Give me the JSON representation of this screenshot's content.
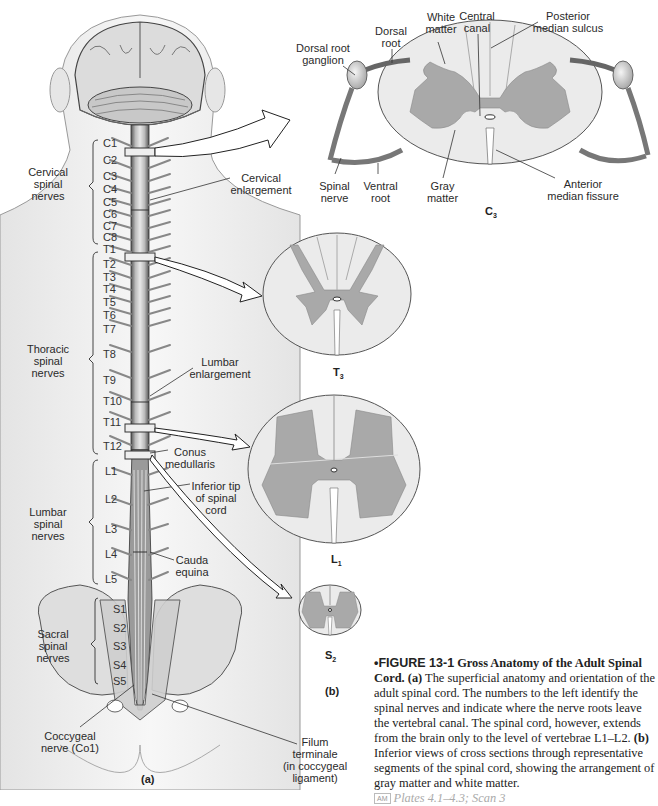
{
  "figure": {
    "number": "•FIGURE 13-1",
    "title": "Gross Anatomy of the Adult Spinal Cord.",
    "panel_a_label": "(a)",
    "panel_b_label": "(b)",
    "caption_a_marker": "(a)",
    "caption_a_text": "The superficial anatomy and orientation of the adult spinal cord. The numbers to the left identify the spinal nerves and indicate where the nerve roots leave the vertebral canal. The spinal cord, however, extends from the brain only to the level of vertebrae",
    "caption_vertebrae": "L1–L2.",
    "caption_b_marker": "(b)",
    "caption_b_text": "Inferior views of cross sections through representative segments of the spinal cord, showing the arrangement of gray matter and white matter.",
    "am_badge": "AM",
    "plates_ref": "Plates 4.1–4.3; Scan 3"
  },
  "colors": {
    "gray_matter": "#a9a9a9",
    "white_matter": "#ebebeb",
    "outline": "#555555",
    "skin": "#f1f1f1",
    "bone": "#dcdcdc"
  },
  "panel_a": {
    "region_labels": {
      "cervical": "Cervical\nspinal\nnerves",
      "thoracic": "Thoracic\nspinal\nnerves",
      "lumbar": "Lumbar\nspinal\nnerves",
      "sacral": "Sacral\nspinal\nnerves"
    },
    "callouts": {
      "cervical_enlargement": "Cervical\nenlargement",
      "lumbar_enlargement": "Lumbar\nenlargement",
      "conus_medullaris": "Conus\nmedullaris",
      "inferior_tip": "Inferior tip\nof spinal\ncord",
      "cauda_equina": "Cauda\nequina",
      "coccygeal_nerve": "Coccygeal\nnerve (Co1)",
      "filum_terminale": "Filum\nterminale\n(in coccygeal\nligament)"
    },
    "segments": {
      "cervical": [
        "C1",
        "C2",
        "C3",
        "C4",
        "C5",
        "C6",
        "C7",
        "C8"
      ],
      "thoracic": [
        "T1",
        "T2",
        "T3",
        "T4",
        "T5",
        "T6",
        "T7",
        "T8",
        "T9",
        "T10",
        "T11",
        "T12"
      ],
      "lumbar": [
        "L1",
        "L2",
        "L3",
        "L4",
        "L5"
      ],
      "sacral": [
        "S1",
        "S2",
        "S3",
        "S4",
        "S5"
      ]
    }
  },
  "panel_b": {
    "c3": {
      "title_letter": "C",
      "title_sub": "3",
      "labels": {
        "dorsal_root_ganglion": "Dorsal root\nganglion",
        "dorsal_root": "Dorsal\nroot",
        "white_matter": "White\nmatter",
        "central_canal": "Central\ncanal",
        "posterior_median_sulcus": "Posterior\nmedian sulcus",
        "spinal_nerve": "Spinal\nnerve",
        "ventral_root": "Ventral\nroot",
        "gray_matter": "Gray\nmatter",
        "anterior_median_fissure": "Anterior\nmedian fissure"
      }
    },
    "t3": {
      "title_letter": "T",
      "title_sub": "3"
    },
    "l1": {
      "title_letter": "L",
      "title_sub": "1"
    },
    "s2": {
      "title_letter": "S",
      "title_sub": "2"
    }
  }
}
